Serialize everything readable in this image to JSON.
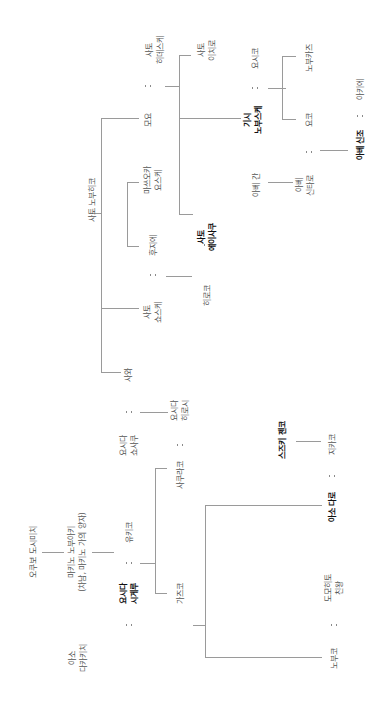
{
  "diagram": {
    "type": "family-tree",
    "orientation": "rotated-90-ccw",
    "people": [
      {
        "id": "sato_noburo",
        "label": "사토 노부히코",
        "bold": false,
        "x": 92,
        "y": 200
      },
      {
        "id": "moyo",
        "label": "모요",
        "bold": false,
        "x": 148,
        "y": 120
      },
      {
        "id": "sato_hidesuke",
        "label": "사토\n히데스케",
        "bold": false,
        "x": 155,
        "y": 50
      },
      {
        "id": "sato_ichiro",
        "label": "사토\n이치로",
        "bold": false,
        "x": 207,
        "y": 50
      },
      {
        "id": "kishi_nobusuke",
        "label": "기시\n노부스케",
        "bold": true,
        "x": 253,
        "y": 120
      },
      {
        "id": "yoshiko",
        "label": "요시코",
        "bold": false,
        "x": 255,
        "y": 58
      },
      {
        "id": "nobukazu",
        "label": "노부카즈",
        "bold": false,
        "x": 309,
        "y": 58
      },
      {
        "id": "yoko",
        "label": "요코",
        "bold": false,
        "x": 309,
        "y": 120
      },
      {
        "id": "abe_kan",
        "label": "아베 간",
        "bold": false,
        "x": 256,
        "y": 185
      },
      {
        "id": "abe_shintaro",
        "label": "아베\n신타로",
        "bold": false,
        "x": 305,
        "y": 185
      },
      {
        "id": "abe_shinzo",
        "label": "아베 신조",
        "bold": true,
        "x": 360,
        "y": 145
      },
      {
        "id": "akie",
        "label": "아키에",
        "bold": false,
        "x": 360,
        "y": 89
      },
      {
        "id": "masuoka_yosuke",
        "label": "마쓰오카\n요스케",
        "bold": false,
        "x": 153,
        "y": 180
      },
      {
        "id": "fujie",
        "label": "후지에",
        "bold": false,
        "x": 153,
        "y": 245
      },
      {
        "id": "sato_eisaku",
        "label": "사토\n에이사쿠",
        "bold": true,
        "x": 207,
        "y": 237
      },
      {
        "id": "hiroko",
        "label": "히로코",
        "bold": false,
        "x": 207,
        "y": 295
      },
      {
        "id": "sato_sosuke",
        "label": "사토\n쇼스케",
        "bold": false,
        "x": 153,
        "y": 312
      },
      {
        "id": "sawa",
        "label": "사와",
        "bold": false,
        "x": 128,
        "y": 375
      },
      {
        "id": "yoshida_shosaku",
        "label": "요시다\n쇼사쿠",
        "bold": false,
        "x": 129,
        "y": 445
      },
      {
        "id": "yoshida_hiroshi",
        "label": "요시다\n히로시",
        "bold": false,
        "x": 180,
        "y": 410
      },
      {
        "id": "sakurako",
        "label": "사쿠라코",
        "bold": false,
        "x": 180,
        "y": 475
      },
      {
        "id": "okubo_toshimichi",
        "label": "오쿠보 도시미치",
        "bold": false,
        "x": 33,
        "y": 552
      },
      {
        "id": "makino_nobuaki",
        "label": "마키노 노부아키\n(차남, 마키노 가의 양자)",
        "bold": false,
        "x": 77,
        "y": 552
      },
      {
        "id": "yukiko",
        "label": "유키코",
        "bold": false,
        "x": 129,
        "y": 532
      },
      {
        "id": "yoshida_shigeru",
        "label": "요시다\n시게루",
        "bold": true,
        "x": 129,
        "y": 593
      },
      {
        "id": "kazuko",
        "label": "가즈코",
        "bold": false,
        "x": 180,
        "y": 593
      },
      {
        "id": "aso_takakichi",
        "label": "아소\n다카키치",
        "bold": false,
        "x": 78,
        "y": 658
      },
      {
        "id": "nobuko",
        "label": "노부코",
        "bold": false,
        "x": 334,
        "y": 658
      },
      {
        "id": "tomohito",
        "label": "도모히토\n친왕",
        "bold": false,
        "x": 334,
        "y": 588
      },
      {
        "id": "aso_taro",
        "label": "아소 다로",
        "bold": true,
        "x": 332,
        "y": 507
      },
      {
        "id": "chikako",
        "label": "지카코",
        "bold": false,
        "x": 332,
        "y": 444
      },
      {
        "id": "suzuki_zenko",
        "label": "스즈키 젠코",
        "bold": true,
        "x": 282,
        "y": 440
      }
    ],
    "marriages": [
      {
        "a": "moyo",
        "b": "sato_hidesuke",
        "x": 148,
        "y": 86
      },
      {
        "a": "kishi_nobusuke",
        "b": "yoshiko",
        "x": 255,
        "y": 88
      },
      {
        "a": "yoko",
        "b": "abe_shintaro",
        "x": 309,
        "y": 152
      },
      {
        "a": "abe_shinzo",
        "b": "akie",
        "x": 360,
        "y": 116
      },
      {
        "a": "fujie",
        "b": "sato_eisaku",
        "x": 153,
        "y": 275
      },
      {
        "a": "sato_eisaku",
        "b": "hiroko",
        "x": 207,
        "y": 245
      },
      {
        "a": "yoshida_shosaku",
        "b": "sawa",
        "x": 129,
        "y": 412
      },
      {
        "a": "yoshida_hiroshi",
        "b": "sakurako",
        "x": 180,
        "y": 445
      },
      {
        "a": "yukiko",
        "b": "yoshida_shigeru",
        "x": 129,
        "y": 563
      },
      {
        "a": "kazuko",
        "b": "aso_takakichi",
        "x": 129,
        "y": 625
      },
      {
        "a": "nobuko",
        "b": "tomohito",
        "x": 334,
        "y": 625
      },
      {
        "a": "aso_taro",
        "b": "chikako",
        "x": 332,
        "y": 476
      }
    ],
    "colors": {
      "line": "#9a9a9a",
      "text": "#555555",
      "bold_text": "#111111",
      "background": "#ffffff"
    }
  }
}
